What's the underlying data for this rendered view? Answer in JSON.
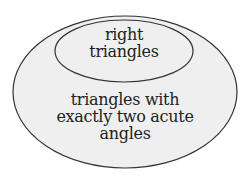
{
  "diagram": {
    "type": "venn-nested",
    "outer_set": {
      "label_lines": [
        "triangles with",
        "exactly two acute",
        "angles"
      ]
    },
    "inner_set": {
      "label_lines": [
        "right",
        "triangles"
      ]
    },
    "colors": {
      "fill": "#efefef",
      "stroke": "#333333",
      "text": "#222222"
    }
  }
}
